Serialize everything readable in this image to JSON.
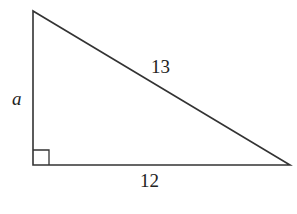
{
  "diagram": {
    "type": "right-triangle",
    "vertices": {
      "top": [
        33,
        11
      ],
      "right_angle": [
        33,
        165
      ],
      "right": [
        290,
        165
      ]
    },
    "labels": {
      "vertical_leg": "a",
      "hypotenuse": "13",
      "base": "12"
    },
    "right_angle_marker": true,
    "stroke_color": "#333333"
  }
}
